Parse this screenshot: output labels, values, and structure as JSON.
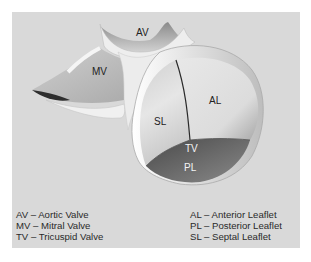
{
  "diagram": {
    "labels": {
      "av": "AV",
      "mv": "MV",
      "al": "AL",
      "sl": "SL",
      "tv": "TV",
      "pl": "PL"
    },
    "legend_left": [
      "AV – Aortic Valve",
      "MV – Mitral Valve",
      "TV – Tricuspid Valve"
    ],
    "legend_right": [
      "AL – Anterior Leaflet",
      "PL – Posterior Leaflet",
      "SL – Septal Leaflet"
    ],
    "colors": {
      "panel": "#d9d9d9",
      "leaflet_light": "#e6e6e6",
      "leaflet_dark": "#6e6e6e",
      "annulus": "#f2f2f2"
    }
  }
}
